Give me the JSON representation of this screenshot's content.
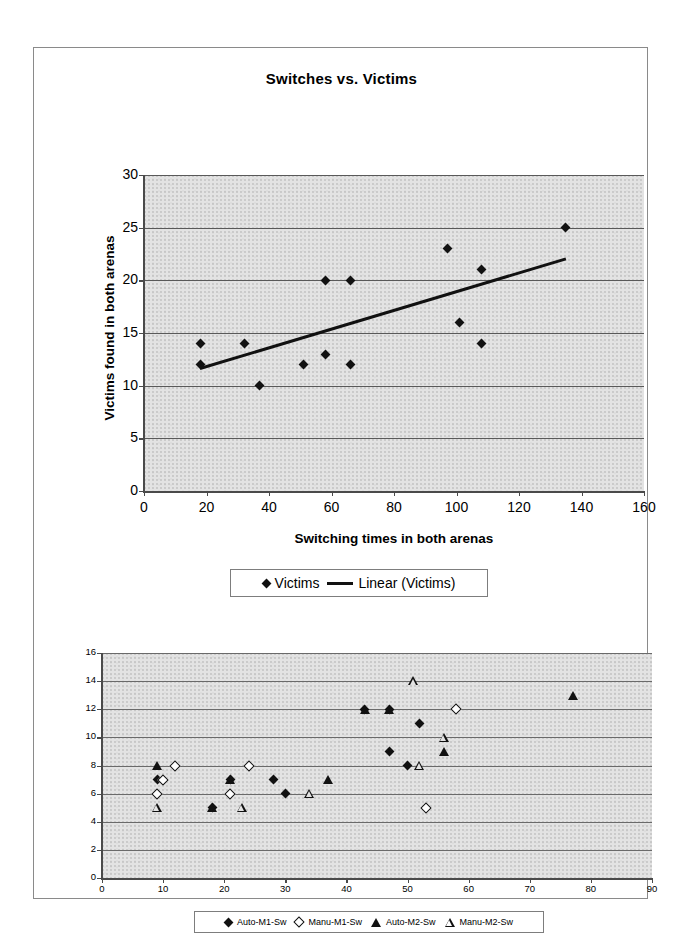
{
  "chart_data": [
    {
      "id": "switches-vs-victims",
      "type": "scatter",
      "title": "Switches vs. Victims",
      "xlabel": "Switching times in both arenas",
      "ylabel": "Victims found in both arenas",
      "xlim": [
        0,
        160
      ],
      "ylim": [
        0,
        30
      ],
      "xticks": [
        0,
        20,
        40,
        60,
        80,
        100,
        120,
        140,
        160
      ],
      "yticks": [
        0,
        5,
        10,
        15,
        20,
        25,
        30
      ],
      "grid": "horizontal",
      "legend_position": "below",
      "series": [
        {
          "name": "Victims",
          "marker": "diamond-filled",
          "points": [
            [
              18,
              12
            ],
            [
              18,
              14
            ],
            [
              32,
              14
            ],
            [
              37,
              10
            ],
            [
              51,
              12
            ],
            [
              58,
              13
            ],
            [
              58,
              20
            ],
            [
              66,
              12
            ],
            [
              66,
              20
            ],
            [
              97,
              23
            ],
            [
              101,
              16
            ],
            [
              108,
              21
            ],
            [
              108,
              14
            ],
            [
              135,
              25
            ]
          ]
        },
        {
          "name": "Linear (Victims)",
          "marker": "line",
          "trendline": {
            "x1": 18,
            "y1": 11.8,
            "x2": 135,
            "y2": 22.2
          }
        }
      ]
    },
    {
      "id": "switching-by-method",
      "type": "scatter",
      "title": "",
      "xlabel": "",
      "ylabel": "",
      "xlim": [
        0,
        90
      ],
      "ylim": [
        0,
        16
      ],
      "xticks": [
        0,
        10,
        20,
        30,
        40,
        50,
        60,
        70,
        80,
        90
      ],
      "yticks": [
        0,
        2,
        4,
        6,
        8,
        10,
        12,
        14,
        16
      ],
      "grid": "horizontal",
      "legend_position": "below",
      "series": [
        {
          "name": "Auto-M1-Sw",
          "marker": "diamond-filled",
          "points": [
            [
              9,
              7
            ],
            [
              18,
              5
            ],
            [
              21,
              7
            ],
            [
              28,
              7
            ],
            [
              30,
              6
            ],
            [
              43,
              12
            ],
            [
              47,
              12
            ],
            [
              47,
              9
            ],
            [
              50,
              8
            ],
            [
              52,
              11
            ]
          ]
        },
        {
          "name": "Manu-M1-Sw",
          "marker": "diamond-open",
          "points": [
            [
              9,
              6
            ],
            [
              10,
              7
            ],
            [
              12,
              8
            ],
            [
              21,
              6
            ],
            [
              24,
              8
            ],
            [
              53,
              5
            ],
            [
              58,
              12
            ]
          ]
        },
        {
          "name": "Auto-M2-Sw",
          "marker": "triangle-filled",
          "points": [
            [
              9,
              8
            ],
            [
              18,
              5
            ],
            [
              21,
              7
            ],
            [
              37,
              7
            ],
            [
              43,
              12
            ],
            [
              47,
              12
            ],
            [
              56,
              9
            ],
            [
              77,
              13
            ]
          ]
        },
        {
          "name": "Manu-M2-Sw",
          "marker": "triangle-open",
          "points": [
            [
              9,
              5
            ],
            [
              23,
              5
            ],
            [
              34,
              6
            ],
            [
              51,
              14
            ],
            [
              52,
              8
            ],
            [
              56,
              10
            ]
          ]
        }
      ]
    }
  ],
  "top_chart": {
    "title": "Switches vs. Victims",
    "y_axis_title": "Victims found in both arenas",
    "x_axis_title": "Switching times in both arenas",
    "y_tick_labels": [
      "30",
      "25",
      "20",
      "15",
      "10",
      "5",
      "0"
    ],
    "x_tick_labels": [
      "0",
      "20",
      "40",
      "60",
      "80",
      "100",
      "120",
      "140",
      "160"
    ],
    "legend": [
      {
        "label": "Victims",
        "marker": "diamond-filled"
      },
      {
        "label": "Linear (Victims)",
        "marker": "line"
      }
    ]
  },
  "bottom_chart": {
    "y_tick_labels": [
      "16",
      "14",
      "12",
      "10",
      "8",
      "6",
      "4",
      "2",
      "0"
    ],
    "x_tick_labels": [
      "0",
      "10",
      "20",
      "30",
      "40",
      "50",
      "60",
      "70",
      "80",
      "90"
    ],
    "legend": [
      {
        "label": "Auto-M1-Sw",
        "marker": "diamond-filled"
      },
      {
        "label": "Manu-M1-Sw",
        "marker": "diamond-open"
      },
      {
        "label": "Auto-M2-Sw",
        "marker": "triangle-filled"
      },
      {
        "label": "Manu-M2-Sw",
        "marker": "triangle-open"
      }
    ]
  },
  "colors": {
    "plot_background": "#e3e3e3",
    "marker": "#111111",
    "gridline": "#595959",
    "page_border": "#8a8a8a"
  }
}
